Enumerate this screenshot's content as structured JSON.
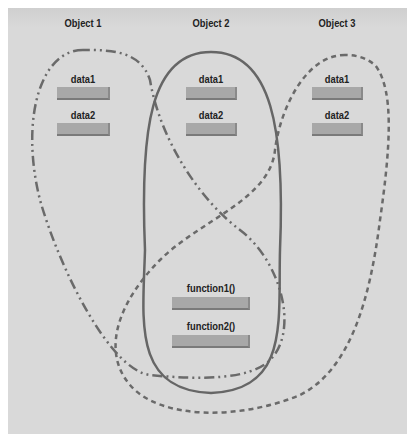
{
  "diagram": {
    "objects": [
      {
        "title": "Object 1",
        "fields": [
          "data1",
          "data2"
        ],
        "outline": "dash-dot"
      },
      {
        "title": "Object 2",
        "fields": [
          "data1",
          "data2"
        ],
        "outline": "solid"
      },
      {
        "title": "Object 3",
        "fields": [
          "data1",
          "data2"
        ],
        "outline": "dashed"
      }
    ],
    "shared_functions": [
      "function1()",
      "function2()"
    ],
    "colors": {
      "background": "#d9d9d9",
      "bar": "#a8a8a8",
      "outline": "#666666",
      "text": "#222222"
    }
  }
}
